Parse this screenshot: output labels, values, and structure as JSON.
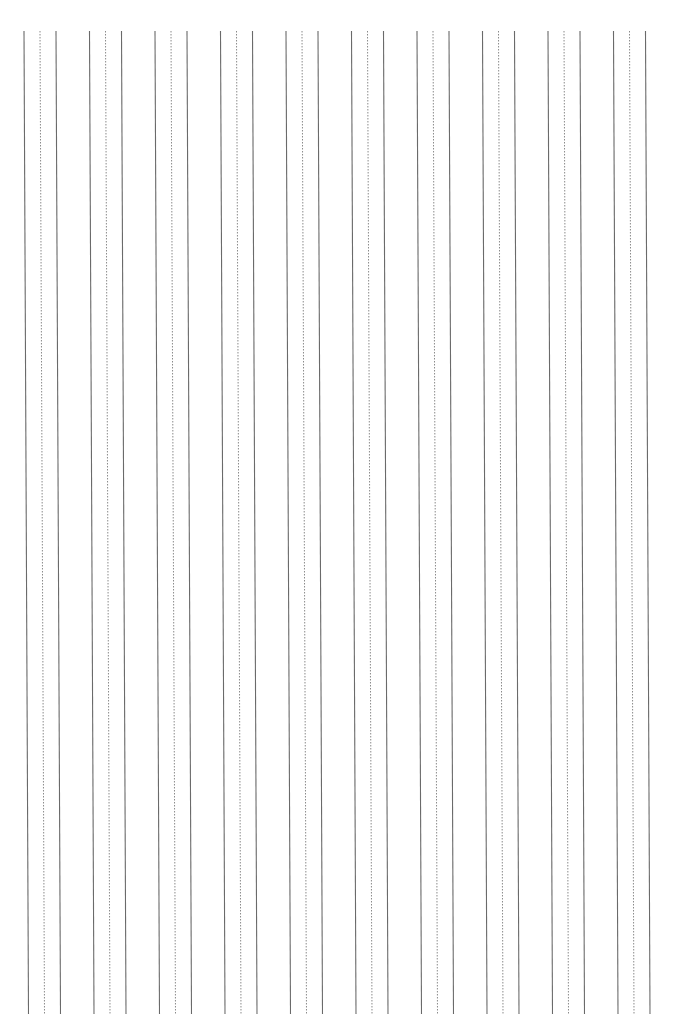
{
  "document": {
    "type": "vertical-lined-practice-paper",
    "column_groups": 10,
    "lines_per_group": [
      "solid",
      "dotted",
      "solid"
    ],
    "colors": {
      "solid_line": "#6a6a6a",
      "dotted_line": "#8a8a8a",
      "background": "#ffffff"
    }
  }
}
